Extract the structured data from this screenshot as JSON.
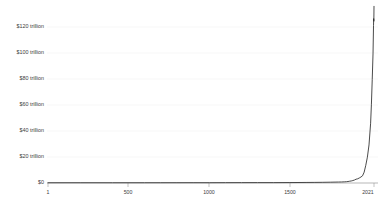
{
  "chart_data": {
    "type": "line",
    "title": "",
    "subtitle": "",
    "xlabel": "",
    "ylabel": "",
    "xlim": [
      1,
      2021
    ],
    "ylim": [
      0,
      131
    ],
    "grid": true,
    "legend": "none",
    "x_ticks": [
      "1",
      "500",
      "1000",
      "1500",
      "2021"
    ],
    "x_tick_values": [
      1,
      500,
      1000,
      1500,
      2021
    ],
    "y_ticks": [
      "$0",
      "$20 trillion",
      "$40 trillion",
      "$60 trillion",
      "$80 trillion",
      "$100 trillion",
      "$120 trillion"
    ],
    "y_tick_values": [
      0,
      20,
      40,
      60,
      80,
      100,
      120
    ],
    "series": [
      {
        "name": "World GDP",
        "x": [
          1,
          200,
          400,
          600,
          700,
          800,
          900,
          1000,
          1100,
          1200,
          1300,
          1400,
          1500,
          1550,
          1600,
          1650,
          1700,
          1750,
          1800,
          1820,
          1840,
          1850,
          1860,
          1870,
          1880,
          1890,
          1900,
          1910,
          1920,
          1930,
          1940,
          1950,
          1960,
          1970,
          1980,
          1990,
          2000,
          2005,
          2010,
          2015,
          2018,
          2019,
          2020,
          2021
        ],
        "values": [
          0.18,
          0.19,
          0.18,
          0.19,
          0.2,
          0.21,
          0.22,
          0.21,
          0.24,
          0.27,
          0.29,
          0.28,
          0.33,
          0.37,
          0.41,
          0.44,
          0.5,
          0.59,
          0.71,
          0.76,
          0.87,
          0.95,
          1.1,
          1.3,
          1.5,
          1.8,
          2.2,
          2.8,
          3.1,
          3.7,
          4.4,
          5.3,
          8.0,
          13.0,
          19.0,
          28.0,
          44.0,
          58.0,
          76.0,
          95.0,
          116.0,
          121.0,
          119.0,
          130.0
        ]
      }
    ],
    "axis_credit": ""
  },
  "caption": {
    "footer_note": ""
  }
}
